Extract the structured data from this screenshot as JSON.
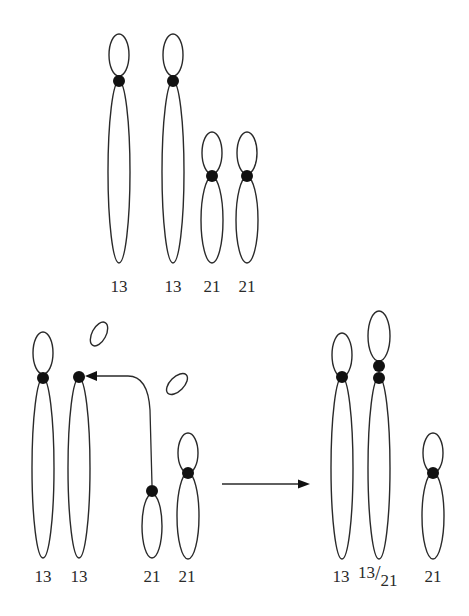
{
  "diagram": {
    "colors": {
      "stroke": "#2a2a2a",
      "centromere": "#111111",
      "background": "#ffffff"
    },
    "panels": [
      {
        "id": "normal-karyotype",
        "chromosomes": [
          {
            "label": "13",
            "x": 119,
            "p_top": 34,
            "cen": 81,
            "q_bottom": 263,
            "p_rx": 10,
            "q_rx": 11
          },
          {
            "label": "13",
            "x": 173,
            "p_top": 34,
            "cen": 81,
            "q_bottom": 263,
            "p_rx": 10,
            "q_rx": 11
          },
          {
            "label": "21",
            "x": 212,
            "p_top": 132,
            "cen": 176,
            "q_bottom": 263,
            "p_rx": 10,
            "q_rx": 11
          },
          {
            "label": "21",
            "x": 247,
            "p_top": 132,
            "cen": 176,
            "q_bottom": 263,
            "p_rx": 10,
            "q_rx": 11
          }
        ],
        "label_y": 288
      },
      {
        "id": "translocation-event",
        "chromosomes": [
          {
            "label": "13",
            "x": 43,
            "p_top": 332,
            "cen": 378,
            "q_bottom": 558,
            "p_rx": 10,
            "q_rx": 11,
            "has_p": true
          },
          {
            "label": "13",
            "x": 79,
            "p_top": null,
            "cen": 377,
            "q_bottom": 558,
            "p_rx": 10,
            "q_rx": 11,
            "has_p": false
          },
          {
            "label": "21",
            "x": 152,
            "p_top": null,
            "cen": 491,
            "q_bottom": 558,
            "p_rx": 10,
            "q_rx": 11,
            "has_p": false
          },
          {
            "label": "21",
            "x": 188,
            "p_top": 433,
            "cen": 473,
            "q_bottom": 558,
            "p_rx": 10,
            "q_rx": 11,
            "has_p": true
          }
        ],
        "lost_fragments": [
          {
            "cx": 99,
            "cy": 334,
            "rx": 7,
            "ry": 13,
            "rotate": 28
          },
          {
            "cx": 177,
            "cy": 384,
            "rx": 7,
            "ry": 13,
            "rotate": 45
          }
        ],
        "label_y": 578
      },
      {
        "id": "result-karyotype",
        "chromosomes": [
          {
            "label": "13",
            "x": 342,
            "p_top": 333,
            "cen": 377,
            "q_bottom": 559,
            "p_rx": 10,
            "q_rx": 11
          },
          {
            "label": "13/21",
            "x": 379,
            "p_top": 311,
            "cen": 366,
            "cen2": 378,
            "q_bottom": 559,
            "p_rx": 11,
            "q_rx": 11,
            "fused": true
          },
          {
            "label": "21",
            "x": 433,
            "p_top": 433,
            "cen": 473,
            "q_bottom": 559,
            "p_rx": 10,
            "q_rx": 11
          }
        ],
        "label_y": 578
      }
    ],
    "fusion_arrow": {
      "from": "chr21-centromere",
      "to": "chr13-centromere"
    },
    "process_arrow": {
      "x1": 222,
      "x2": 310,
      "y": 484
    },
    "labels": {
      "top": [
        "13",
        "13",
        "21",
        "21"
      ],
      "bottom_left": [
        "13",
        "13",
        "21",
        "21"
      ],
      "bottom_right": [
        "13",
        "13/21",
        "21"
      ],
      "fused_numerator": "13",
      "fused_slash": "/",
      "fused_denominator": "21"
    }
  }
}
